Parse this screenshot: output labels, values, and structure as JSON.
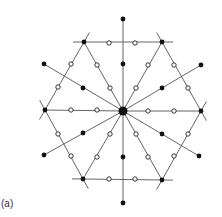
{
  "figure": {
    "panel_label": "(a)",
    "colors": {
      "line": "#555555",
      "filled_dot": "#111111",
      "open_dot_fill": "#ffffff",
      "open_dot_stroke": "#222222"
    },
    "center": {
      "x": 123,
      "y": 111,
      "r": 4.5
    },
    "hexagon_vertices": [
      {
        "x": 84,
        "y": 42
      },
      {
        "x": 162,
        "y": 42
      },
      {
        "x": 201,
        "y": 111
      },
      {
        "x": 162,
        "y": 180
      },
      {
        "x": 83,
        "y": 179
      },
      {
        "x": 45,
        "y": 110
      }
    ],
    "outer_filled_dots": [
      {
        "x": 123,
        "y": 19
      },
      {
        "x": 201,
        "y": 65
      },
      {
        "x": 199,
        "y": 156
      },
      {
        "x": 123,
        "y": 203
      },
      {
        "x": 44,
        "y": 155
      },
      {
        "x": 44,
        "y": 64
      }
    ],
    "inner_filled_dots": [
      {
        "x": 123,
        "y": 64
      },
      {
        "x": 162,
        "y": 88
      },
      {
        "x": 162,
        "y": 134
      },
      {
        "x": 123,
        "y": 157
      },
      {
        "x": 83,
        "y": 133
      },
      {
        "x": 83,
        "y": 88
      }
    ],
    "open_dots": [
      {
        "x": 109,
        "y": 43
      },
      {
        "x": 135,
        "y": 43
      },
      {
        "x": 109,
        "y": 179
      },
      {
        "x": 135,
        "y": 179
      },
      {
        "x": 71,
        "y": 64
      },
      {
        "x": 58,
        "y": 87
      },
      {
        "x": 71,
        "y": 156
      },
      {
        "x": 58,
        "y": 134
      },
      {
        "x": 174,
        "y": 65
      },
      {
        "x": 188,
        "y": 88
      },
      {
        "x": 174,
        "y": 156
      },
      {
        "x": 188,
        "y": 134
      },
      {
        "x": 97,
        "y": 65
      },
      {
        "x": 110,
        "y": 88
      },
      {
        "x": 148,
        "y": 65
      },
      {
        "x": 136,
        "y": 88
      },
      {
        "x": 97,
        "y": 157
      },
      {
        "x": 110,
        "y": 134
      },
      {
        "x": 148,
        "y": 157
      },
      {
        "x": 136,
        "y": 134
      },
      {
        "x": 71,
        "y": 110
      },
      {
        "x": 97,
        "y": 110
      },
      {
        "x": 148,
        "y": 111
      },
      {
        "x": 174,
        "y": 111
      }
    ]
  }
}
